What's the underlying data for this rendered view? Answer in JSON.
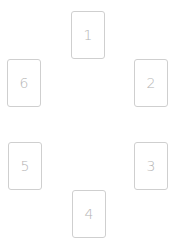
{
  "layout": {
    "name": "six-card-circular-spread",
    "card_count": 6
  },
  "colors": {
    "background": "#ffffff",
    "card_border": "#cfcfcf",
    "card_label": "#b4b4b4"
  },
  "cards": [
    {
      "position": 1,
      "label": "1"
    },
    {
      "position": 2,
      "label": "2"
    },
    {
      "position": 3,
      "label": "3"
    },
    {
      "position": 4,
      "label": "4"
    },
    {
      "position": 5,
      "label": "5"
    },
    {
      "position": 6,
      "label": "6"
    }
  ]
}
